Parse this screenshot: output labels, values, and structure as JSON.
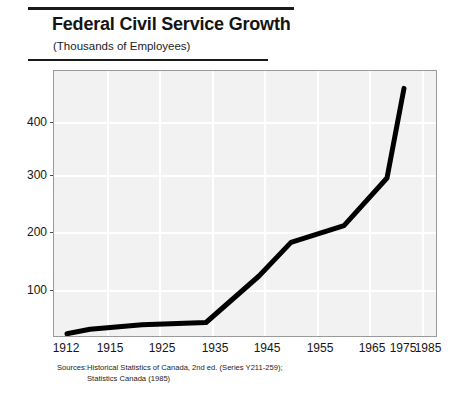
{
  "header": {
    "title": "Federal Civil Service Growth",
    "subtitle": "(Thousands of Employees)"
  },
  "sources": {
    "label": "Sources:",
    "line1": "Historical Statistics of Canada, 2nd ed. (Series Y211-259);",
    "line2": "Statistics Canada (1985)"
  },
  "colors": {
    "line": "#000000",
    "plot_background": "#f2f2f2",
    "gridline": "#ffffff",
    "frame": "#9a9a9a",
    "rule": "#1a1a1a",
    "text": "#141414"
  },
  "chart_data": {
    "type": "line",
    "title": "Federal Civil Service Growth",
    "subtitle": "(Thousands of Employees)",
    "xlabel": "",
    "ylabel": "",
    "categories": [
      "1912",
      "1915",
      "1925",
      "1935",
      "1945",
      "1955",
      "1965",
      "1975",
      "1985"
    ],
    "x": [
      1912,
      1915,
      1925,
      1935,
      1945,
      1955,
      1965,
      1975,
      1985
    ],
    "values": [
      22,
      30,
      38,
      42,
      125,
      185,
      215,
      300,
      460
    ],
    "series": [
      {
        "name": "Federal Civil Service Employees",
        "values": [
          22,
          30,
          38,
          42,
          125,
          185,
          215,
          300,
          460
        ]
      }
    ],
    "ytick_labels": [
      "100",
      "200",
      "300",
      "400"
    ],
    "yticks": [
      100,
      200,
      300,
      400
    ],
    "ylim": [
      0,
      480
    ],
    "xlim": [
      0,
      8
    ],
    "grid": true,
    "legend": "none",
    "units": "thousands of employees"
  }
}
